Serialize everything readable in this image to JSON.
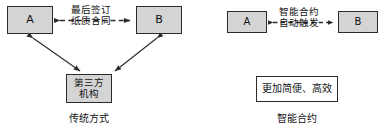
{
  "canvas": {
    "width": 390,
    "height": 134,
    "background": "#ffffff"
  },
  "colors": {
    "stroke": "#2b2b2b",
    "node_fill": "#d4d4d4",
    "plain_fill": "#ffffff",
    "text": "#111111"
  },
  "left_panel": {
    "caption": "传统方式",
    "nodes": {
      "party_a": "A",
      "party_b": "B",
      "third_party": "第三方\n机构"
    },
    "edge_label": "最后签订\n纸质合同"
  },
  "right_panel": {
    "caption": "智能合约",
    "nodes": {
      "party_a": "A",
      "party_b": "B",
      "benefit": "更加简便、高效"
    },
    "edge_label": "智能合约\n自动触发"
  }
}
